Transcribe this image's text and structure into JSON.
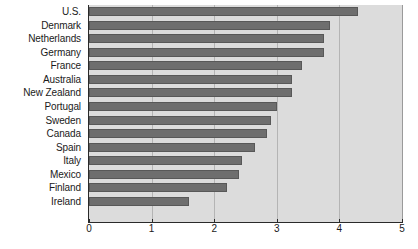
{
  "chart_data": {
    "type": "bar",
    "orientation": "horizontal",
    "title": "",
    "subtitle": "",
    "xlabel": "",
    "ylabel": "",
    "xlim": [
      0,
      5
    ],
    "ylim": null,
    "grid": true,
    "legend": null,
    "xticks": [
      "0",
      "1",
      "2",
      "3",
      "4",
      "5"
    ],
    "xtick_values": [
      0,
      1,
      2,
      3,
      4,
      5
    ],
    "categories": [
      "U.S.",
      "Denmark",
      "Netherlands",
      "Germany",
      "France",
      "Australia",
      "New Zealand",
      "Portugal",
      "Sweden",
      "Canada",
      "Spain",
      "Italy",
      "Mexico",
      "Finland",
      "Ireland"
    ],
    "values": [
      4.3,
      3.85,
      3.75,
      3.75,
      3.4,
      3.25,
      3.25,
      3.0,
      2.9,
      2.85,
      2.65,
      2.45,
      2.4,
      2.2,
      1.6
    ],
    "colors": {
      "bar_fill": "#6e6e6e",
      "bar_edge": "#585858",
      "plot_background": "#dcdcdc",
      "gridline": "#b4b4b4",
      "axis": "#2a2a2a",
      "text": "#1a1a1a",
      "page_background": "#ffffff"
    }
  }
}
